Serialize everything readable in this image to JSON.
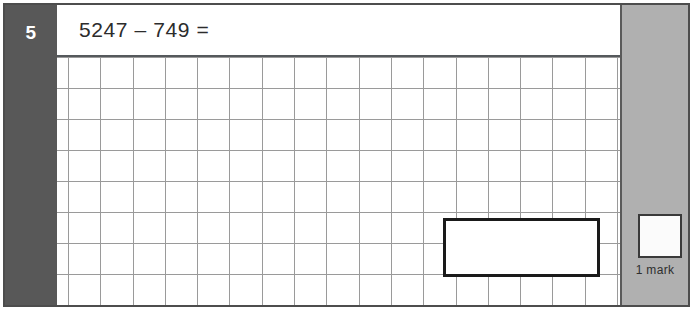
{
  "question": {
    "number": "5",
    "text": "5247 – 749 ="
  },
  "answer_box": {
    "value": ""
  },
  "marking": {
    "box_value": "",
    "label": "1 mark"
  },
  "colors": {
    "number_column": "#585858",
    "mark_margin": "#b0b0b0",
    "grid_line": "#9a9a9a",
    "frame": "#4d4d4d",
    "answer_box_border": "#1a1a1a",
    "text": "#2c2c2c",
    "number_text": "#ffffff"
  },
  "grid": {
    "columns": 17,
    "rows": 8
  }
}
